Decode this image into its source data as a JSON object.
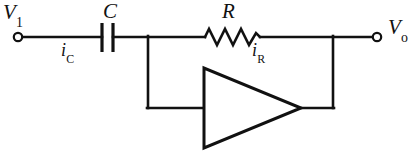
{
  "diagram": {
    "type": "schematic",
    "background_color": "#ffffff",
    "line_color": "#111111",
    "labels": {
      "input_node": {
        "symbol": "V",
        "subscript": "1"
      },
      "output_node": {
        "symbol": "V",
        "subscript": "o"
      },
      "capacitor": {
        "symbol": "C"
      },
      "resistor": {
        "symbol": "R"
      },
      "capacitor_current": {
        "symbol": "i",
        "subscript": "C"
      },
      "resistor_current": {
        "symbol": "i",
        "subscript": "R"
      }
    },
    "components": [
      {
        "name": "input-terminal",
        "kind": "terminal",
        "x": 18,
        "y": 37
      },
      {
        "name": "capacitor",
        "kind": "capacitor",
        "x": 107,
        "y": 37
      },
      {
        "name": "resistor",
        "kind": "resistor",
        "x": 232,
        "y": 37
      },
      {
        "name": "amplifier",
        "kind": "triangle-amplifier",
        "x": 251,
        "y": 108
      },
      {
        "name": "output-terminal",
        "kind": "terminal",
        "x": 376,
        "y": 37
      }
    ],
    "wires": [
      {
        "name": "input-wire",
        "from": [
          18,
          37
        ],
        "to": [
          102,
          37
        ]
      },
      {
        "name": "capacitor-to-node-wire",
        "from": [
          112,
          37
        ],
        "to": [
          205,
          37
        ]
      },
      {
        "name": "resistor-to-output-wire",
        "from": [
          260,
          37
        ],
        "to": [
          376,
          37
        ]
      },
      {
        "name": "inverting-input-drop",
        "from": [
          148,
          37
        ],
        "to": [
          148,
          108
        ]
      },
      {
        "name": "inverting-input-wire",
        "from": [
          148,
          108
        ],
        "to": [
          204,
          108
        ]
      },
      {
        "name": "output-node-drop",
        "from": [
          333,
          37
        ],
        "to": [
          333,
          108
        ]
      },
      {
        "name": "amplifier-output-wire",
        "from": [
          300,
          108
        ],
        "to": [
          333,
          108
        ]
      }
    ]
  }
}
